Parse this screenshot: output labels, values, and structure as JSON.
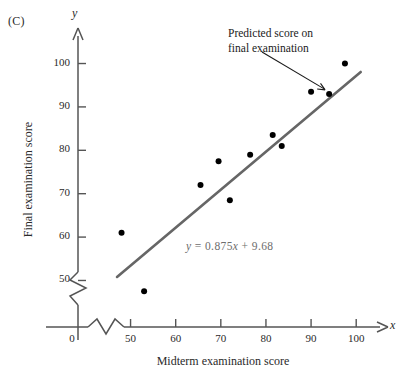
{
  "figure": {
    "panel_label": "(C)",
    "x_axis_variable": "x",
    "y_axis_variable": "y"
  },
  "annotation": {
    "line1": "Predicted score on",
    "line2": "final examination"
  },
  "chart_data": {
    "type": "scatter",
    "title": "(C)",
    "xlabel": "Midterm examination score",
    "ylabel": "Final examination score",
    "xlim": [
      45,
      103
    ],
    "ylim": [
      45,
      104
    ],
    "xticks": [
      0,
      50,
      60,
      70,
      80,
      90,
      100
    ],
    "yticks": [
      50,
      60,
      70,
      80,
      90,
      100
    ],
    "xtick_labels": [
      "0",
      "50",
      "60",
      "70",
      "80",
      "90",
      "100"
    ],
    "ytick_labels": [
      "50",
      "60",
      "70",
      "80",
      "90",
      "100"
    ],
    "axis_break": true,
    "grid": false,
    "legend": false,
    "points": [
      {
        "x": 48.0,
        "y": 61.0
      },
      {
        "x": 53.0,
        "y": 47.5
      },
      {
        "x": 65.5,
        "y": 72.0
      },
      {
        "x": 69.5,
        "y": 77.5
      },
      {
        "x": 72.0,
        "y": 68.5
      },
      {
        "x": 76.5,
        "y": 79.0
      },
      {
        "x": 81.5,
        "y": 83.5
      },
      {
        "x": 83.5,
        "y": 81.0
      },
      {
        "x": 90.0,
        "y": 93.5
      },
      {
        "x": 94.0,
        "y": 93.0
      },
      {
        "x": 97.5,
        "y": 100.0
      }
    ],
    "highlighted_point": {
      "x": 94.0,
      "y": 93.0,
      "label": "Predicted score on final examination"
    },
    "regression_line": {
      "equation": "y = 0.875x + 9.68",
      "slope": 0.875,
      "intercept": 9.68,
      "x_start": 47.0,
      "x_end": 101.0,
      "color": "#666666"
    },
    "marker_color": "#000000",
    "axis_color": "#555555"
  }
}
